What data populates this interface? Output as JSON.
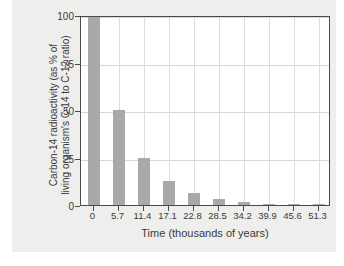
{
  "chart_data": {
    "type": "bar",
    "title": "",
    "subtitle": "",
    "xlabel": "Time (thousands of years)",
    "ylabel_line1": "Carbon-14 radioactivity (as % of",
    "ylabel_line2": "living organism's C-14 to C-12 ratio)",
    "ylabel": "Carbon-14 radioactivity (as % of living organism's C-14 to C-12 ratio)",
    "categories": [
      "0",
      "5.7",
      "11.4",
      "17.1",
      "22.8",
      "28.5",
      "34.2",
      "39.9",
      "45.6",
      "51.3"
    ],
    "x": [
      0,
      5.7,
      11.4,
      17.1,
      22.8,
      28.5,
      34.2,
      39.9,
      45.6,
      51.3
    ],
    "values": [
      100,
      50,
      25,
      12.5,
      6.25,
      3.13,
      1.56,
      0.78,
      0.39,
      0.2
    ],
    "ylim": [
      0,
      100
    ],
    "xlim": [
      -2.85,
      54.15
    ],
    "yticks": [
      0,
      25,
      50,
      75,
      100
    ],
    "ytick_labels": [
      "0",
      "25",
      "50",
      "75",
      "100"
    ],
    "xticks": [
      0,
      5.7,
      11.4,
      17.1,
      22.8,
      28.5,
      34.2,
      39.9,
      45.6,
      51.3
    ],
    "grid": true,
    "grid_axis": "both",
    "legend": false,
    "legend_position": "none",
    "bar_color": "#a9a9a9",
    "frame_color": "#4a4a4a",
    "grid_color": "#d8d8d8",
    "plot_background": "#ffffff",
    "figure_background": "#eeeeec",
    "annotations": []
  }
}
